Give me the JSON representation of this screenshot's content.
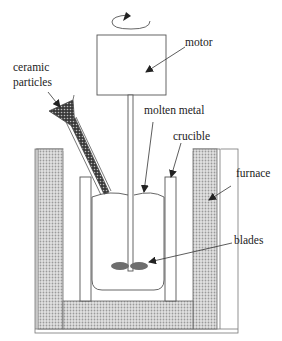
{
  "diagram": {
    "type": "stir-casting-apparatus",
    "labels": {
      "motor": "motor",
      "ceramic_particles_line1": "ceramic",
      "ceramic_particles_line2": "particles",
      "molten_metal": "molten metal",
      "crucible": "crucible",
      "furnace": "furnace",
      "blades": "blades"
    },
    "components": [
      {
        "id": "motor",
        "shape": "rectangle"
      },
      {
        "id": "rotation-arrow",
        "shape": "ellipse-arrow"
      },
      {
        "id": "shaft",
        "shape": "rod"
      },
      {
        "id": "blades",
        "shape": "two-ellipses"
      },
      {
        "id": "crucible",
        "shape": "open-vessel"
      },
      {
        "id": "molten-metal",
        "shape": "rounded-body"
      },
      {
        "id": "furnace",
        "shape": "insulated-walls"
      },
      {
        "id": "hopper",
        "shape": "funnel-tube"
      }
    ],
    "colors": {
      "line": "#555555",
      "insulation": "#c8c8c8",
      "blade": "#707070",
      "particles": "#333333"
    }
  }
}
